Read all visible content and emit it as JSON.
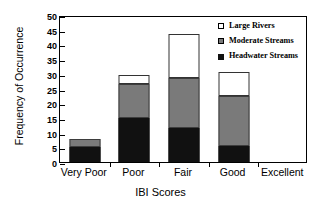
{
  "chart_data": {
    "type": "bar",
    "stacked": true,
    "title": "",
    "xlabel": "IBI Scores",
    "ylabel": "Frequency of Occurrence",
    "categories": [
      "Very Poor",
      "Poor",
      "Fair",
      "Good",
      "Excellent"
    ],
    "ylim": [
      0,
      50
    ],
    "yticks": [
      0,
      5,
      10,
      15,
      20,
      25,
      30,
      35,
      40,
      45,
      50
    ],
    "grid": false,
    "legend_position": "top-right inside",
    "series": [
      {
        "name": "Headwater Streams",
        "color": "#111111",
        "values": [
          5,
          15,
          11.5,
          5.5,
          0
        ]
      },
      {
        "name": "Moderate Streams",
        "color": "#7a7a7a",
        "values": [
          3,
          11.5,
          17,
          17,
          0
        ]
      },
      {
        "name": "Large Rivers",
        "color": "#ffffff",
        "values": [
          0,
          3,
          15,
          8,
          0
        ]
      }
    ],
    "totals": [
      8,
      29.5,
      43.5,
      30.5,
      0
    ]
  },
  "legend": {
    "items": [
      {
        "label": "Large Rivers",
        "swatch": "legend-swatch-white"
      },
      {
        "label": "Moderate Streams",
        "swatch": "legend-swatch-gray"
      },
      {
        "label": "Headwater Streams",
        "swatch": "legend-swatch-black"
      }
    ]
  }
}
